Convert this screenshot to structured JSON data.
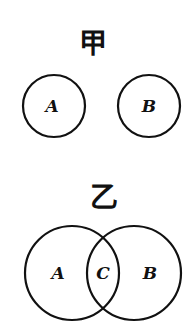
{
  "figures": [
    {
      "title": "甲",
      "description": "Two disjoint circles",
      "sets": [
        {
          "label": "A",
          "cx": 54,
          "cy": 106,
          "r": 31
        },
        {
          "label": "B",
          "cx": 149,
          "cy": 106,
          "r": 31
        }
      ]
    },
    {
      "title": "乙",
      "description": "Two overlapping circles with intersection C",
      "sets": [
        {
          "label": "A",
          "cx": 72,
          "cy": 273,
          "r": 47
        },
        {
          "label": "B",
          "cx": 134,
          "cy": 273,
          "r": 47
        }
      ],
      "intersection_label": "C"
    }
  ],
  "colors": {
    "stroke": "#111111",
    "background": "#ffffff"
  }
}
